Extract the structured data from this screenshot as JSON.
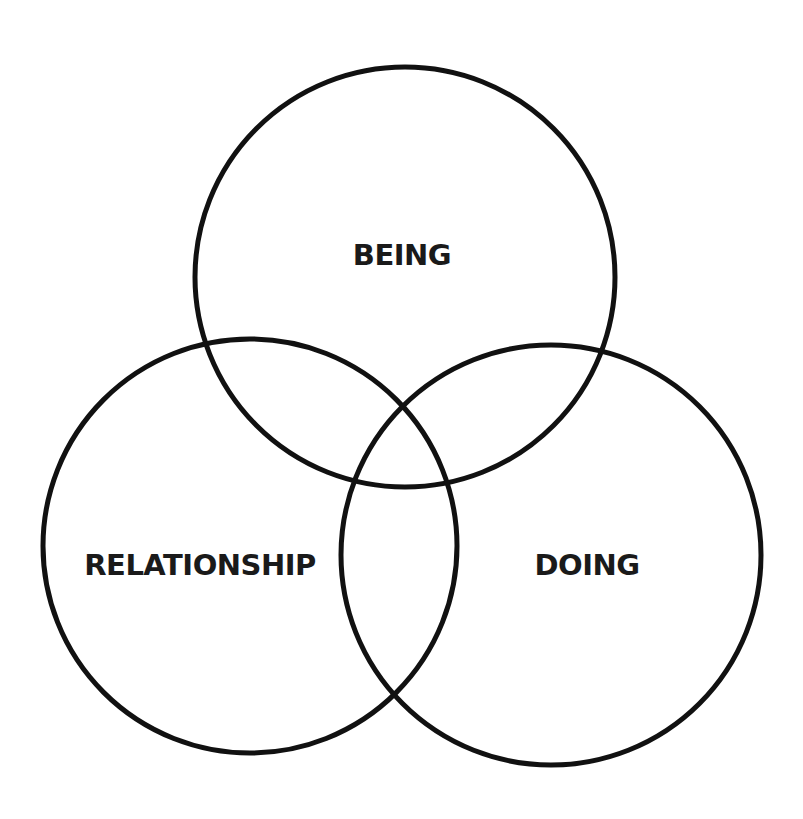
{
  "diagram": {
    "type": "venn",
    "stroke_color": "#111111",
    "background": "#ffffff",
    "circles": [
      {
        "id": "being",
        "label": "BEING",
        "cx": 405,
        "cy": 277,
        "r": 210,
        "label_x": 402,
        "label_y": 255
      },
      {
        "id": "relationship",
        "label": "RELATIONSHIP",
        "cx": 250,
        "cy": 546,
        "r": 207,
        "label_x": 200,
        "label_y": 565
      },
      {
        "id": "doing",
        "label": "DOING",
        "cx": 551,
        "cy": 555,
        "r": 210,
        "label_x": 587,
        "label_y": 565
      }
    ]
  }
}
